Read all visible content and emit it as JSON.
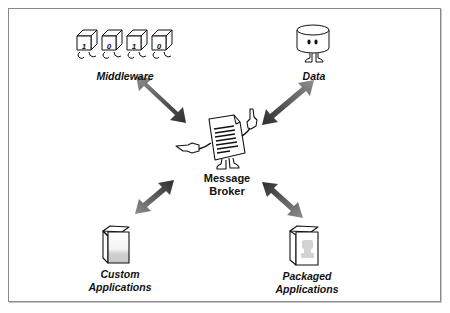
{
  "nodes": {
    "middleware": {
      "label": "Middleware",
      "icon": "binary-cubes-icon",
      "bits": [
        "1",
        "0",
        "1",
        "0"
      ]
    },
    "data": {
      "label": "Data",
      "icon": "database-cylinder-icon"
    },
    "broker": {
      "label_line1": "Message",
      "label_line2": "Broker",
      "icon": "document-character-icon"
    },
    "custom_apps": {
      "label_line1": "Custom",
      "label_line2": "Applications",
      "icon": "box-icon"
    },
    "packaged_apps": {
      "label_line1": "Packaged",
      "label_line2": "Applications",
      "icon": "packaged-box-icon"
    }
  },
  "edges": [
    {
      "from": "middleware",
      "to": "broker",
      "style": "double-arrow"
    },
    {
      "from": "data",
      "to": "broker",
      "style": "double-arrow"
    },
    {
      "from": "custom_apps",
      "to": "broker",
      "style": "double-arrow"
    },
    {
      "from": "packaged_apps",
      "to": "broker",
      "style": "double-arrow"
    }
  ],
  "colors": {
    "arrow_dark": "#3a3a3a",
    "arrow_light": "#8c8c8c",
    "frame": "#8a8a8a",
    "stroke": "#111111"
  }
}
